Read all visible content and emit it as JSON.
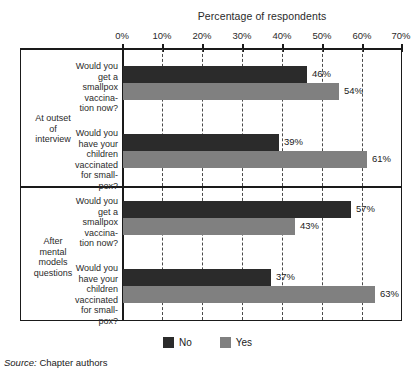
{
  "chart_data": {
    "type": "bar",
    "orientation": "horizontal",
    "title": "Percentage of respondents",
    "xlabel": "",
    "ylabel": "",
    "xlim": [
      0,
      70
    ],
    "xticks": [
      "0%",
      "10%",
      "20%",
      "30%",
      "40%",
      "50%",
      "60%",
      "70%"
    ],
    "xtick_values": [
      0,
      10,
      20,
      30,
      40,
      50,
      60,
      70
    ],
    "grid": "vertical-dashed",
    "legend_position": "bottom-center",
    "legend": [
      {
        "name": "No",
        "color": "#2b2b2b"
      },
      {
        "name": "Yes",
        "color": "#808080"
      }
    ],
    "groups": [
      {
        "group_label": "At outset of interview",
        "questions": [
          {
            "question": "Would you get a smallpox vaccination now?",
            "bars": [
              {
                "series": "No",
                "value": 46,
                "label": "46%"
              },
              {
                "series": "Yes",
                "value": 54,
                "label": "54%"
              }
            ]
          },
          {
            "question": "Would you have your children vaccinated for smallpox?",
            "bars": [
              {
                "series": "No",
                "value": 39,
                "label": "39%"
              },
              {
                "series": "Yes",
                "value": 61,
                "label": "61%"
              }
            ]
          }
        ]
      },
      {
        "group_label": "After mental models questions",
        "questions": [
          {
            "question": "Would you get a smallpox vaccination now?",
            "bars": [
              {
                "series": "No",
                "value": 57,
                "label": "57%"
              },
              {
                "series": "Yes",
                "value": 43,
                "label": "43%"
              }
            ]
          },
          {
            "question": "Would you have your children vaccinated for smallpox?",
            "bars": [
              {
                "series": "No",
                "value": 37,
                "label": "37%"
              },
              {
                "series": "Yes",
                "value": 63,
                "label": "63%"
              }
            ]
          }
        ]
      }
    ],
    "series": [
      {
        "name": "No",
        "values": [
          46,
          39,
          57,
          37
        ]
      },
      {
        "name": "Yes",
        "values": [
          54,
          61,
          43,
          63
        ]
      }
    ],
    "categories": [
      "At outset of interview / vaccination now",
      "At outset of interview / children vaccinated",
      "After mental models questions / vaccination now",
      "After mental models questions / children vaccinated"
    ]
  },
  "labels": {
    "group_1": "At outset\nof\ninterview",
    "group_2": "After\nmental\nmodels\nquestions",
    "question_1": "Would you\nget a\nsmallpox\nvaccina-\ntion now?",
    "question_2": "Would you\nhave your\nchildren\nvaccinated\nfor small-\npox?",
    "question_3": "Would you\nget a\nsmallpox\nvaccina-\ntion now?",
    "question_4": "Would you\nhave your\nchildren\nvaccinated\nfor small-\npox?"
  },
  "values": {
    "v1_no": "46%",
    "v1_yes": "54%",
    "v2_no": "39%",
    "v2_yes": "61%",
    "v3_no": "57%",
    "v3_yes": "43%",
    "v4_no": "37%",
    "v4_yes": "63%"
  },
  "ticks": {
    "t0": "0%",
    "t1": "10%",
    "t2": "20%",
    "t3": "30%",
    "t4": "40%",
    "t5": "50%",
    "t6": "60%",
    "t7": "70%"
  },
  "legend": {
    "no_label": "No",
    "yes_label": "Yes"
  },
  "source": {
    "label": "Source:",
    "text": "Chapter authors"
  },
  "colors": {
    "no": "#2b2b2b",
    "yes": "#808080",
    "axis": "#1a1a1a",
    "grid": "#4a4a4a"
  }
}
